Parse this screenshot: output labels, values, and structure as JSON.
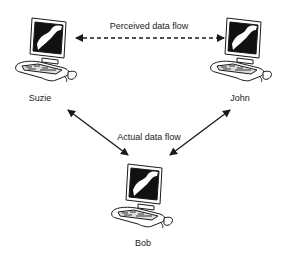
{
  "diagram": {
    "nodes": [
      {
        "id": "suzie",
        "label": "Suzie",
        "icon": "desktop-computer-icon"
      },
      {
        "id": "john",
        "label": "John",
        "icon": "desktop-computer-icon"
      },
      {
        "id": "bob",
        "label": "Bob",
        "icon": "desktop-computer-icon"
      }
    ],
    "edges": [
      {
        "from": "suzie",
        "to": "john",
        "label": "Perceived data flow",
        "style": "dashed",
        "direction": "bidirectional"
      },
      {
        "from": "suzie",
        "to": "bob",
        "label": "Actual data flow",
        "style": "solid",
        "direction": "bidirectional"
      },
      {
        "from": "john",
        "to": "bob",
        "label": "Actual data flow",
        "style": "solid",
        "direction": "bidirectional"
      }
    ],
    "perceived_label": "Perceived data flow",
    "actual_label": "Actual data flow"
  },
  "colors": {
    "line": "#1a1a1a",
    "background": "#ffffff"
  }
}
